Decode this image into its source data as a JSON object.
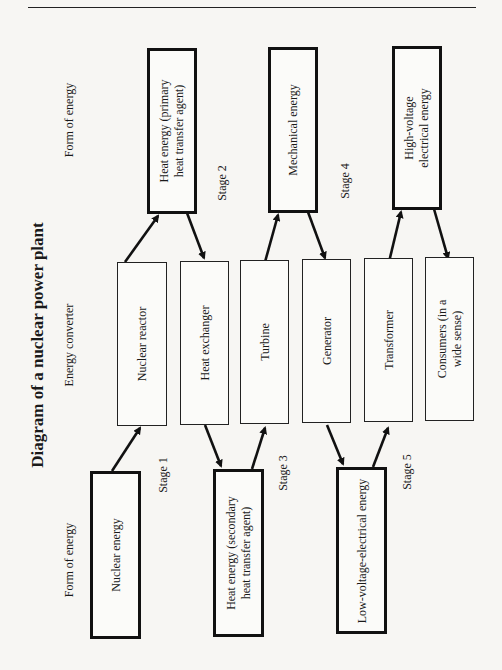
{
  "title": "Diagram of a nuclear power plant",
  "column_headers": {
    "form_of_energy_top": "Form of energy",
    "energy_converter": "Energy converter",
    "form_of_energy_bottom": "Form of energy"
  },
  "energy_forms": [
    {
      "label": "Nuclear energy"
    },
    {
      "label": "Heat energy (primary\nheat transfer agent)"
    },
    {
      "label": "Heat energy (secondary\nheat transfer agent)"
    },
    {
      "label": "Mechanical energy"
    },
    {
      "label": "Low-voltage-electrical energy"
    },
    {
      "label": "High-voltage\nelectrical energy"
    }
  ],
  "converters": [
    {
      "label": "Nuclear reactor"
    },
    {
      "label": "Heat exchanger"
    },
    {
      "label": "Turbine"
    },
    {
      "label": "Generator"
    },
    {
      "label": "Transformer"
    },
    {
      "label": "Consumers (in a\nwide sense)"
    }
  ],
  "stages": [
    {
      "label": "Stage 1"
    },
    {
      "label": "Stage 2"
    },
    {
      "label": "Stage 3"
    },
    {
      "label": "Stage 4"
    },
    {
      "label": "Stage 5"
    }
  ],
  "flow": [
    "Nuclear energy → Nuclear reactor",
    "Nuclear reactor → Heat energy (primary heat transfer agent)",
    "Heat energy (primary heat transfer agent) → Heat exchanger",
    "Heat exchanger → Heat energy (secondary heat transfer agent)",
    "Heat energy (secondary heat transfer agent) → Turbine",
    "Turbine → Mechanical energy",
    "Mechanical energy → Generator",
    "Generator → Low-voltage-electrical energy",
    "Low-voltage-electrical energy → Transformer",
    "Transformer → High-voltage electrical energy",
    "High-voltage electrical energy → Consumers (in a wide sense)"
  ]
}
